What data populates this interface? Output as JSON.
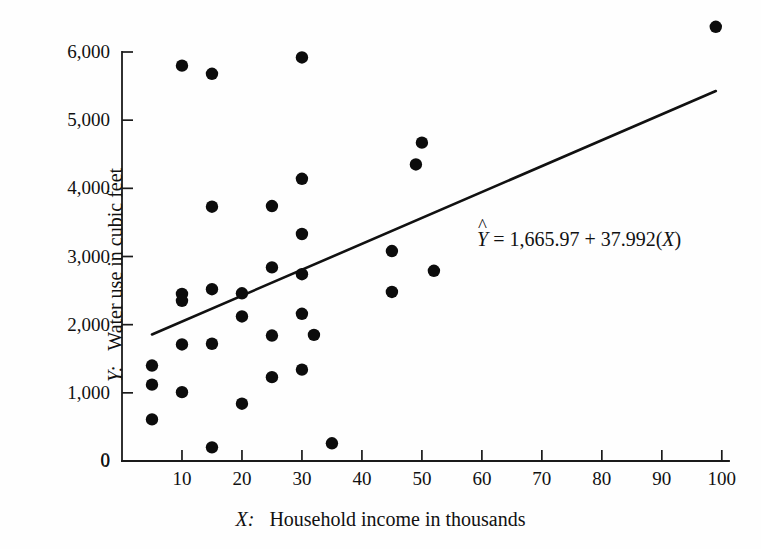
{
  "figure": {
    "background_color": "#fefefe",
    "ink_color": "#111111"
  },
  "axes": {
    "y": {
      "title_prefix": "Y:",
      "title_text": "Water use in cubic feet",
      "ticks": [
        "0",
        "1,000",
        "2,000",
        "3,000",
        "4,000",
        "5,000",
        "6,000"
      ],
      "tick_values": [
        0,
        1000,
        2000,
        3000,
        4000,
        5000,
        6000
      ]
    },
    "x": {
      "title_prefix": "X:",
      "title_text": "Household income in thousands",
      "ticks": [
        "0",
        "10",
        "20",
        "30",
        "40",
        "50",
        "60",
        "70",
        "80",
        "90",
        "100"
      ],
      "tick_values": [
        0,
        10,
        20,
        30,
        40,
        50,
        60,
        70,
        80,
        90,
        100
      ]
    }
  },
  "annotation": {
    "equation_var": "Y",
    "equation_hat": "^",
    "equation_rest": " = 1,665.97 + 37.992(",
    "equation_x": "X",
    "equation_close": ")",
    "equation_full": "Ŷ = 1,665.97 + 37.992(X)",
    "intercept": 1665.97,
    "slope": 37.992
  },
  "chart_data": {
    "type": "scatter",
    "title": "",
    "xlabel": "X:   Household income in thousands",
    "ylabel": "Y:   Water use in cubic feet",
    "xlim": [
      0,
      103
    ],
    "ylim": [
      0,
      6500
    ],
    "grid": false,
    "legend": "none",
    "marker": "filled-circle",
    "marker_color": "#0c0c0c",
    "x": [
      5,
      5,
      5,
      10,
      10,
      10,
      10,
      10,
      15,
      15,
      15,
      15,
      20,
      20,
      20,
      25,
      25,
      25,
      25,
      30,
      30,
      30,
      30,
      30,
      30,
      35,
      35,
      45,
      45,
      49,
      50,
      52,
      99
    ],
    "y": [
      1400,
      1120,
      610,
      5800,
      2450,
      2350,
      1710,
      1010,
      5680,
      3730,
      2520,
      1720,
      2460,
      2120,
      840,
      3740,
      2840,
      1840,
      1230,
      5920,
      4140,
      3330,
      2740,
      2160,
      1340,
      1850,
      260,
      3080,
      2480,
      4350,
      4670,
      2790,
      6370
    ],
    "points": [
      {
        "x": 5,
        "y": 1400
      },
      {
        "x": 5,
        "y": 1120
      },
      {
        "x": 5,
        "y": 610
      },
      {
        "x": 10,
        "y": 5800
      },
      {
        "x": 10,
        "y": 2450
      },
      {
        "x": 10,
        "y": 2350
      },
      {
        "x": 10,
        "y": 1710
      },
      {
        "x": 10,
        "y": 1010
      },
      {
        "x": 15,
        "y": 5680
      },
      {
        "x": 15,
        "y": 3730
      },
      {
        "x": 15,
        "y": 2520
      },
      {
        "x": 15,
        "y": 1720
      },
      {
        "x": 15,
        "y": 200
      },
      {
        "x": 20,
        "y": 2460
      },
      {
        "x": 20,
        "y": 2120
      },
      {
        "x": 20,
        "y": 840
      },
      {
        "x": 25,
        "y": 3740
      },
      {
        "x": 25,
        "y": 2840
      },
      {
        "x": 25,
        "y": 1840
      },
      {
        "x": 25,
        "y": 1230
      },
      {
        "x": 30,
        "y": 5920
      },
      {
        "x": 30,
        "y": 4140
      },
      {
        "x": 30,
        "y": 3330
      },
      {
        "x": 30,
        "y": 2740
      },
      {
        "x": 30,
        "y": 2160
      },
      {
        "x": 30,
        "y": 1340
      },
      {
        "x": 32,
        "y": 1850
      },
      {
        "x": 35,
        "y": 260
      },
      {
        "x": 45,
        "y": 3080
      },
      {
        "x": 45,
        "y": 2480
      },
      {
        "x": 49,
        "y": 4350
      },
      {
        "x": 50,
        "y": 4670
      },
      {
        "x": 52,
        "y": 2790
      },
      {
        "x": 99,
        "y": 6370
      }
    ],
    "fit_line": {
      "label": "Ŷ = 1,665.97 + 37.992(X)",
      "x_start": 5,
      "y_start": 1856,
      "x_end": 99,
      "y_end": 5427
    }
  }
}
